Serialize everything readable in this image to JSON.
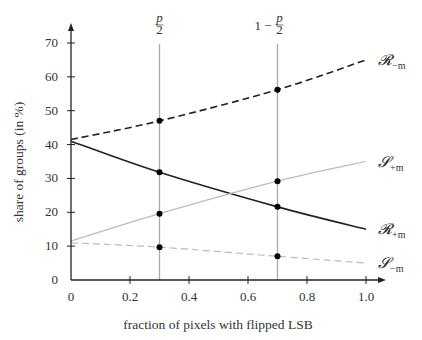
{
  "chart_data": {
    "type": "line",
    "title": "",
    "xlabel": "fraction of pixels with flipped LSB",
    "ylabel": "share of groups (in %)",
    "xlim": [
      0,
      1.0
    ],
    "ylim": [
      0,
      70
    ],
    "xticks": [
      0,
      0.2,
      0.4,
      0.6,
      0.8,
      1.0
    ],
    "xtick_labels": [
      "0",
      "0.2",
      "0.4",
      "0.6",
      "0.8",
      "1.0"
    ],
    "yticks": [
      0,
      10,
      20,
      30,
      40,
      50,
      60,
      70
    ],
    "ytick_labels": [
      "0",
      "10",
      "20",
      "30",
      "40",
      "50",
      "60",
      "70"
    ],
    "grid": false,
    "vertical_markers": [
      {
        "x": 0.3,
        "label_main": "p/2",
        "label": "p/2"
      },
      {
        "x": 0.7,
        "label_main": "1 − p/2",
        "label": "1 − p/2"
      }
    ],
    "series": [
      {
        "name": "R−m",
        "label_main": "𝓡",
        "label_sub": "−m",
        "style": "dashed",
        "color": "#222222",
        "x": [
          0,
          0.3,
          0.7,
          1.0
        ],
        "values": [
          41.5,
          47,
          56.2,
          65
        ]
      },
      {
        "name": "R+m",
        "label_main": "𝓡",
        "label_sub": "+m",
        "style": "solid",
        "color": "#222222",
        "x": [
          0,
          0.3,
          0.7,
          1.0
        ],
        "values": [
          41,
          31.8,
          21.6,
          15
        ]
      },
      {
        "name": "S+m",
        "label_main": "𝓢",
        "label_sub": "+m",
        "style": "solid",
        "color": "#bbbbbb",
        "x": [
          0,
          0.3,
          0.7,
          1.0
        ],
        "values": [
          11.5,
          19.6,
          29.2,
          35
        ]
      },
      {
        "name": "S−m",
        "label_main": "𝓢",
        "label_sub": "−m",
        "style": "dashed",
        "color": "#bbbbbb",
        "x": [
          0,
          0.3,
          0.7,
          1.0
        ],
        "values": [
          11,
          9.7,
          7,
          5
        ]
      }
    ],
    "highlighted_points_x": [
      0.3,
      0.7
    ]
  }
}
